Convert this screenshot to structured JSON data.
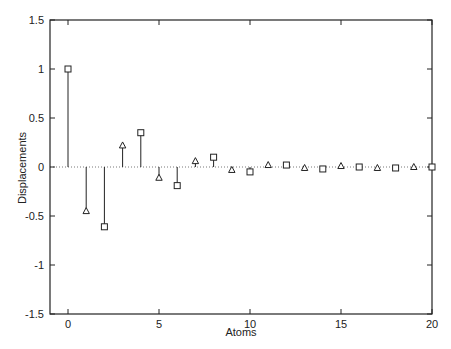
{
  "chart_data": {
    "type": "stem",
    "title": "",
    "xlabel": "Atoms",
    "ylabel": "Displacements",
    "xlim": [
      -1.5,
      20
    ],
    "ylim": [
      -1.5,
      1.5
    ],
    "xticks": [
      0,
      5,
      10,
      15,
      20
    ],
    "xtick_labels": [
      "0",
      "5",
      "10",
      "15",
      "20"
    ],
    "yticks": [
      1.5,
      1,
      0.5,
      0,
      -0.5,
      -1,
      -1.5
    ],
    "ytick_labels": [
      "1.5",
      "1",
      "0.5",
      "0",
      "-0.5",
      "-1",
      "-1.5"
    ],
    "grid": false,
    "zero_line": "dotted",
    "series": [
      {
        "name": "even atoms",
        "marker": "square",
        "x": [
          0,
          2,
          4,
          6,
          8,
          10,
          12,
          14,
          16,
          18,
          20
        ],
        "values": [
          1.0,
          -0.61,
          0.35,
          -0.19,
          0.1,
          -0.05,
          0.02,
          -0.02,
          0.0,
          -0.01,
          0.0
        ]
      },
      {
        "name": "odd atoms",
        "marker": "triangle",
        "x": [
          1,
          3,
          5,
          7,
          9,
          11,
          13,
          15,
          17,
          19
        ],
        "values": [
          -0.45,
          0.22,
          -0.11,
          0.06,
          -0.03,
          0.02,
          -0.01,
          0.01,
          -0.01,
          0.0
        ]
      }
    ],
    "colors": {
      "line": "#222222",
      "frame": "#222222",
      "zero_line": "#555555"
    }
  }
}
